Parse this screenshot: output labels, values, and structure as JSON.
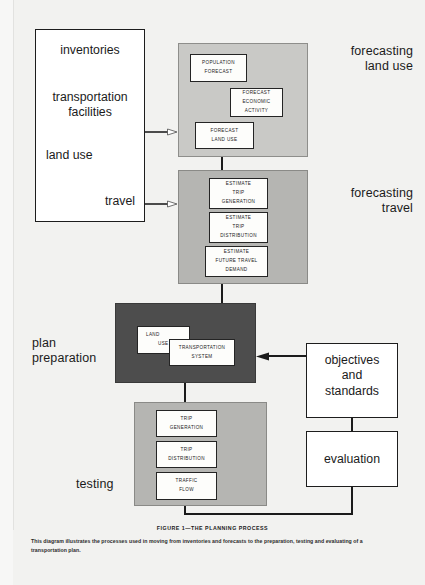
{
  "figure": {
    "caption_title": "FIGURE 1—THE PLANNING PROCESS",
    "caption_body": "This diagram illustrates the processes used in moving from inventories and forecasts to the preparation, testing and evaluating of a transportation plan."
  },
  "stage_labels": {
    "forecasting_land_use": "forecasting\nland use",
    "forecasting_travel": "forecasting\ntravel",
    "plan_preparation": "plan\npreparation",
    "testing": "testing"
  },
  "inventories_card": {
    "items": [
      {
        "text": "inventories",
        "align": "center"
      },
      {
        "text": "transportation\nfacilities",
        "align": "center"
      },
      {
        "text": "land use",
        "align": "left"
      },
      {
        "text": "travel",
        "align": "right"
      }
    ]
  },
  "forecasting_land_use_group": {
    "boxes": [
      {
        "lines": [
          "POPULATION",
          "FORECAST"
        ]
      },
      {
        "lines": [
          "FORECAST",
          "ECONOMIC",
          "ACTIVITY"
        ]
      },
      {
        "lines": [
          "FORECAST",
          "LAND  USE"
        ]
      }
    ]
  },
  "forecasting_travel_group": {
    "boxes": [
      {
        "lines": [
          "ESTIMATE",
          "TRIP",
          "GENERATION"
        ]
      },
      {
        "lines": [
          "ESTIMATE",
          "TRIP",
          "DISTRIBUTION"
        ]
      },
      {
        "lines": [
          "ESTIMATE",
          "FUTURE  TRAVEL",
          "DEMAND"
        ]
      }
    ]
  },
  "plan_preparation_group": {
    "boxes": [
      {
        "lines": [
          "LAND",
          "USE"
        ]
      },
      {
        "lines": [
          "TRANSPORTATION",
          "SYSTEM"
        ]
      }
    ]
  },
  "testing_group": {
    "boxes": [
      {
        "lines": [
          "TRIP",
          "GENERATION"
        ]
      },
      {
        "lines": [
          "TRIP",
          "DISTRIBUTION"
        ]
      },
      {
        "lines": [
          "TRAFFIC",
          "FLOW"
        ]
      }
    ]
  },
  "right_cards": {
    "objectives": "objectives\nand\nstandards",
    "evaluation": "evaluation"
  },
  "colors": {
    "page_background": "#f2f2f0",
    "group_light": "#c9c9c6",
    "group_mid": "#b5b5b2",
    "group_dark": "#4d4d4d",
    "stroke": "#1b1b1b",
    "box_fill": "#fdfdfb"
  }
}
